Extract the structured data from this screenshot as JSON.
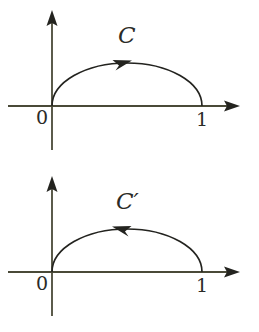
{
  "figure": {
    "background_color": "#ffffff",
    "axis_color": "#4a4a38",
    "curve_color": "#23231f",
    "text_color": "#2b2b27",
    "panels": [
      {
        "id": "curve-c",
        "curve_label": "C",
        "orientation": "counterclockwise",
        "arrow_direction": "right",
        "axis_labels": {
          "origin": "0",
          "endpoint": "1"
        },
        "axes": {
          "x_axis": {
            "from_x": 8,
            "to_x": 240,
            "y": 106,
            "arrow": "right"
          },
          "y_axis": {
            "x": 52,
            "from_y": 150,
            "to_y": 10,
            "arrow": "up"
          }
        },
        "curve": {
          "type": "semicircular-arc",
          "start": [
            52,
            106
          ],
          "end": [
            202,
            106
          ],
          "apex": [
            127,
            64
          ],
          "arrow_at": [
            120,
            62
          ]
        }
      },
      {
        "id": "curve-c-prime",
        "curve_label": "C′",
        "orientation": "clockwise",
        "arrow_direction": "left",
        "axis_labels": {
          "origin": "0",
          "endpoint": "1"
        },
        "axes": {
          "x_axis": {
            "from_x": 8,
            "to_x": 240,
            "y": 106,
            "arrow": "right"
          },
          "y_axis": {
            "x": 52,
            "from_y": 150,
            "to_y": 10,
            "arrow": "up"
          }
        },
        "curve": {
          "type": "semicircular-arc",
          "start": [
            52,
            106
          ],
          "end": [
            202,
            106
          ],
          "apex": [
            127,
            64
          ],
          "arrow_at": [
            128,
            62
          ]
        }
      }
    ]
  }
}
